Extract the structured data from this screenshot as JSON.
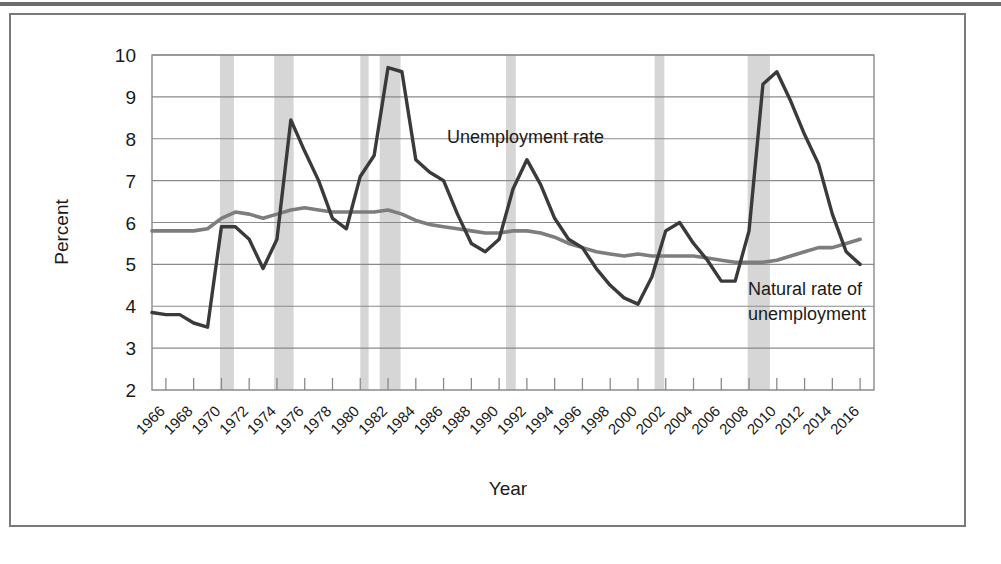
{
  "figure": {
    "ylabel": "Percent",
    "xlabel": "Year",
    "annotations": {
      "unemployment": "Unemployment rate",
      "natural_line1": "Natural rate of",
      "natural_line2": "unemployment"
    },
    "colors": {
      "unemployment_line": "#3a3a3a",
      "natural_line": "#7d7d7d",
      "recession_band": "#cfcfcf",
      "grid": "#8a8a8a",
      "frame": "#7a7a7a"
    }
  },
  "chart_data": {
    "type": "line",
    "title": "",
    "xlabel": "Year",
    "ylabel": "Percent",
    "xlim": [
      1965,
      2017
    ],
    "ylim": [
      2,
      10
    ],
    "yticks": [
      2,
      3,
      4,
      5,
      6,
      7,
      8,
      9,
      10
    ],
    "grid": true,
    "legend": "inline-annotation",
    "x": [
      1965,
      1966,
      1967,
      1968,
      1969,
      1970,
      1971,
      1972,
      1973,
      1974,
      1975,
      1976,
      1977,
      1978,
      1979,
      1980,
      1981,
      1982,
      1983,
      1984,
      1985,
      1986,
      1987,
      1988,
      1989,
      1990,
      1991,
      1992,
      1993,
      1994,
      1995,
      1996,
      1997,
      1998,
      1999,
      2000,
      2001,
      2002,
      2003,
      2004,
      2005,
      2006,
      2007,
      2008,
      2009,
      2010,
      2011,
      2012,
      2013,
      2014,
      2015,
      2016
    ],
    "xticks": [
      1966,
      1968,
      1970,
      1972,
      1974,
      1976,
      1978,
      1980,
      1982,
      1984,
      1986,
      1988,
      1990,
      1992,
      1994,
      1996,
      1998,
      2000,
      2002,
      2004,
      2006,
      2008,
      2010,
      2012,
      2014,
      2016
    ],
    "xticklabels": [
      "1966",
      "1968",
      "1970",
      "1972",
      "1974",
      "1976",
      "1978",
      "1980",
      "1982",
      "1984",
      "1986",
      "1988",
      "1990",
      "1992",
      "1994",
      "1996",
      "1998",
      "2000",
      "2002",
      "2004",
      "2006",
      "2008",
      "2010",
      "2012",
      "2014",
      "2016"
    ],
    "series": [
      {
        "name": "Unemployment rate",
        "color": "#3a3a3a",
        "values": [
          3.85,
          3.8,
          3.8,
          3.6,
          3.5,
          5.9,
          5.9,
          5.6,
          4.9,
          5.6,
          8.45,
          7.7,
          7.0,
          6.1,
          5.85,
          7.1,
          7.6,
          9.7,
          9.6,
          7.5,
          7.2,
          7.0,
          6.2,
          5.5,
          5.3,
          5.6,
          6.8,
          7.5,
          6.9,
          6.1,
          5.6,
          5.4,
          4.9,
          4.5,
          4.2,
          4.05,
          4.7,
          5.8,
          6.0,
          5.5,
          5.1,
          4.6,
          4.6,
          5.8,
          9.3,
          9.6,
          8.9,
          8.1,
          7.4,
          6.2,
          5.3,
          5.0
        ]
      },
      {
        "name": "Natural rate of unemployment",
        "color": "#7d7d7d",
        "values": [
          5.8,
          5.8,
          5.8,
          5.8,
          5.85,
          6.1,
          6.25,
          6.2,
          6.1,
          6.2,
          6.3,
          6.35,
          6.3,
          6.25,
          6.25,
          6.25,
          6.25,
          6.3,
          6.2,
          6.05,
          5.95,
          5.9,
          5.85,
          5.8,
          5.75,
          5.75,
          5.8,
          5.8,
          5.75,
          5.65,
          5.5,
          5.4,
          5.3,
          5.25,
          5.2,
          5.25,
          5.2,
          5.2,
          5.2,
          5.2,
          5.15,
          5.1,
          5.05,
          5.05,
          5.05,
          5.1,
          5.2,
          5.3,
          5.4,
          5.4,
          5.5,
          5.6
        ]
      }
    ],
    "recessions": [
      {
        "start": 1969.9,
        "end": 1970.9
      },
      {
        "start": 1973.8,
        "end": 1975.2
      },
      {
        "start": 1980.0,
        "end": 1980.6
      },
      {
        "start": 1981.4,
        "end": 1982.9
      },
      {
        "start": 1990.5,
        "end": 1991.2
      },
      {
        "start": 2001.2,
        "end": 2001.9
      },
      {
        "start": 2007.9,
        "end": 2009.5
      }
    ]
  }
}
